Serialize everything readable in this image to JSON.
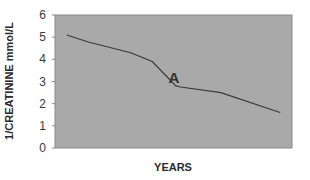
{
  "chart_data": {
    "type": "line",
    "title": "",
    "xlabel": "YEARS",
    "ylabel": "1/CREATININE mmol/L",
    "ylim": [
      0,
      6
    ],
    "yticks": [
      0,
      1,
      2,
      3,
      4,
      5,
      6
    ],
    "grid": false,
    "legend": null,
    "plot_background": "#a9a9a9",
    "line_color": "#3a3a3a",
    "series": [
      {
        "name": "1/creatinine",
        "x": [
          0.05,
          0.14,
          0.32,
          0.41,
          0.51,
          0.53,
          0.7,
          0.95
        ],
        "values": [
          5.1,
          4.78,
          4.3,
          3.9,
          2.8,
          2.75,
          2.5,
          1.6
        ]
      }
    ],
    "annotations": [
      {
        "text": "A",
        "x": 0.5,
        "y": 3.2
      }
    ]
  }
}
